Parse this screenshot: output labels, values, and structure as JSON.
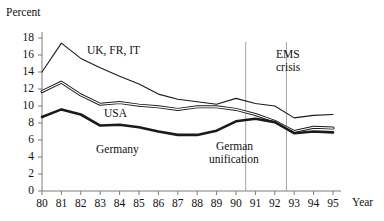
{
  "chart_data": {
    "type": "line",
    "title": "",
    "xlabel": "Year",
    "ylabel": "Percent",
    "ylim": [
      0,
      18
    ],
    "xlim": [
      80,
      95
    ],
    "grid": false,
    "legend_position": "inline-annotations",
    "x": [
      80,
      81,
      82,
      83,
      84,
      85,
      86,
      87,
      88,
      89,
      90,
      91,
      92,
      93,
      94,
      95
    ],
    "xtick_labels": [
      "80",
      "81",
      "82",
      "83",
      "84",
      "85",
      "86",
      "87",
      "88",
      "89",
      "90",
      "91",
      "92",
      "93",
      "94",
      "95"
    ],
    "ytick_labels": [
      "0",
      "2",
      "4",
      "6",
      "8",
      "10",
      "12",
      "14",
      "16",
      "18"
    ],
    "ytick_values": [
      0,
      2,
      4,
      6,
      8,
      10,
      12,
      14,
      16,
      18
    ],
    "series": [
      {
        "name": "UK, FR, IT",
        "values": [
          14.0,
          17.4,
          15.6,
          14.5,
          13.5,
          12.6,
          11.4,
          10.8,
          10.5,
          10.2,
          10.9,
          10.3,
          10.0,
          8.6,
          8.9,
          9.0
        ],
        "line_style": "thin",
        "color": "#1a1a1a"
      },
      {
        "name": "USA",
        "values": [
          11.7,
          12.8,
          11.3,
          10.2,
          10.4,
          10.1,
          9.9,
          9.6,
          9.9,
          9.9,
          9.6,
          9.0,
          8.2,
          7.0,
          7.5,
          7.4
        ],
        "line_style": "double",
        "color": "#1a1a1a"
      },
      {
        "name": "Germany",
        "values": [
          8.7,
          9.6,
          9.0,
          7.7,
          7.8,
          7.5,
          7.0,
          6.6,
          6.6,
          7.1,
          8.2,
          8.5,
          8.1,
          6.8,
          7.0,
          6.9
        ],
        "line_style": "thick",
        "color": "#1a1a1a"
      }
    ],
    "annotations": [
      {
        "text": "UK, FR, IT",
        "x": 84.0,
        "y": 15.6
      },
      {
        "text": "USA",
        "x": 84.5,
        "y": 9.3
      },
      {
        "text": "Germany",
        "x": 84.4,
        "y": 4.6
      },
      {
        "text": "EMS crisis",
        "x": 92.6,
        "y": 15.2
      },
      {
        "text": "German unification",
        "x": 89.6,
        "y": 4.4
      }
    ],
    "vertical_reference_lines": [
      {
        "label": "German unification",
        "x": 90.5
      },
      {
        "label": "EMS crisis",
        "x": 92.6
      }
    ]
  },
  "labels": {
    "y_axis_title": "Percent",
    "x_axis_title": "Year",
    "series_uk_fr_it": "UK, FR, IT",
    "series_usa": "USA",
    "series_germany": "Germany",
    "annot_ems_line1": "EMS",
    "annot_ems_line2": "crisis",
    "annot_unification_line1": "German",
    "annot_unification_line2": "unification"
  },
  "ticks": {
    "y": [
      "18",
      "16",
      "14",
      "12",
      "10",
      "8",
      "6",
      "4",
      "2",
      "0"
    ],
    "x": [
      "80",
      "81",
      "82",
      "83",
      "84",
      "85",
      "86",
      "87",
      "88",
      "89",
      "90",
      "91",
      "92",
      "93",
      "94",
      "95"
    ]
  },
  "colors": {
    "line": "#1a1a1a",
    "axis": "#7a7a7a",
    "reference_line": "#9a9a9a",
    "background": "#ffffff"
  }
}
